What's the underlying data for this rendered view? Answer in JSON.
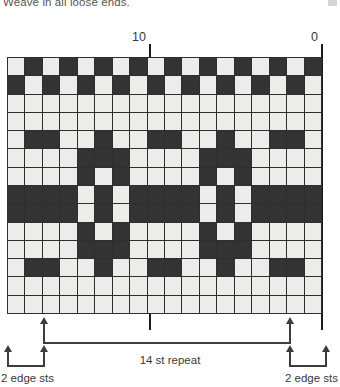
{
  "instruction": {
    "text": "Weave in all loose ends."
  },
  "chart": {
    "type": "knitting-colorwork-chart",
    "columns": 18,
    "rows": 14,
    "colors": {
      "light": "#ececeb",
      "dark": "#333333",
      "grid": "#2e2e2e"
    },
    "column_labels": [
      {
        "value": "10",
        "column_from_right": 10
      },
      {
        "value": "0",
        "column_from_right": 0
      }
    ],
    "legend_keys": {
      "light": "main color",
      "dark": "contrast color"
    },
    "grid_rows": [
      [
        "L",
        "D",
        "L",
        "D",
        "L",
        "D",
        "L",
        "D",
        "L",
        "D",
        "L",
        "D",
        "L",
        "D",
        "L",
        "D",
        "L",
        "D"
      ],
      [
        "D",
        "L",
        "D",
        "L",
        "D",
        "L",
        "D",
        "L",
        "D",
        "L",
        "D",
        "L",
        "D",
        "L",
        "D",
        "L",
        "D",
        "L"
      ],
      [
        "L",
        "L",
        "L",
        "L",
        "L",
        "L",
        "L",
        "L",
        "L",
        "L",
        "L",
        "L",
        "L",
        "L",
        "L",
        "L",
        "L",
        "L"
      ],
      [
        "L",
        "L",
        "L",
        "L",
        "L",
        "L",
        "L",
        "L",
        "L",
        "L",
        "L",
        "L",
        "L",
        "L",
        "L",
        "L",
        "L",
        "L"
      ],
      [
        "L",
        "D",
        "D",
        "L",
        "L",
        "D",
        "L",
        "L",
        "D",
        "D",
        "L",
        "L",
        "D",
        "L",
        "L",
        "D",
        "D",
        "L"
      ],
      [
        "L",
        "L",
        "L",
        "L",
        "D",
        "D",
        "D",
        "L",
        "L",
        "L",
        "L",
        "D",
        "D",
        "D",
        "L",
        "L",
        "L",
        "L"
      ],
      [
        "L",
        "L",
        "L",
        "L",
        "D",
        "L",
        "D",
        "L",
        "L",
        "L",
        "L",
        "D",
        "L",
        "D",
        "L",
        "L",
        "L",
        "L"
      ],
      [
        "D",
        "D",
        "D",
        "D",
        "L",
        "D",
        "L",
        "D",
        "D",
        "D",
        "D",
        "L",
        "D",
        "L",
        "D",
        "D",
        "D",
        "D"
      ],
      [
        "D",
        "D",
        "D",
        "D",
        "L",
        "D",
        "L",
        "D",
        "D",
        "D",
        "D",
        "L",
        "D",
        "L",
        "D",
        "D",
        "D",
        "D"
      ],
      [
        "L",
        "L",
        "L",
        "L",
        "D",
        "L",
        "D",
        "L",
        "L",
        "L",
        "L",
        "D",
        "L",
        "D",
        "L",
        "L",
        "L",
        "L"
      ],
      [
        "L",
        "L",
        "L",
        "L",
        "D",
        "D",
        "D",
        "L",
        "L",
        "L",
        "L",
        "D",
        "D",
        "D",
        "L",
        "L",
        "L",
        "L"
      ],
      [
        "L",
        "D",
        "D",
        "L",
        "L",
        "D",
        "L",
        "L",
        "D",
        "D",
        "L",
        "L",
        "D",
        "L",
        "L",
        "D",
        "D",
        "L"
      ],
      [
        "L",
        "L",
        "L",
        "L",
        "L",
        "L",
        "L",
        "L",
        "L",
        "L",
        "L",
        "L",
        "L",
        "L",
        "L",
        "L",
        "L",
        "L"
      ],
      [
        "L",
        "L",
        "L",
        "L",
        "L",
        "L",
        "L",
        "L",
        "L",
        "L",
        "L",
        "L",
        "L",
        "L",
        "L",
        "L",
        "L",
        "L"
      ]
    ]
  },
  "annotations": {
    "repeat_label": "14 st repeat",
    "edge_label_left": "2 edge sts",
    "edge_label_right": "2 edge sts"
  }
}
